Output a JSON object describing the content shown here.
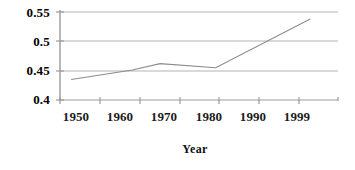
{
  "chart_data": {
    "type": "line",
    "title": "",
    "xlabel": "Year",
    "ylabel": "",
    "xlim": [
      1950,
      2000
    ],
    "ylim": [
      0.4,
      0.55
    ],
    "grid": true,
    "legend": "none",
    "x_tick_labels": [
      "1950",
      "1960",
      "1970",
      "1980",
      "1990",
      "1999"
    ],
    "x_tick_values": [
      1950,
      1960,
      1970,
      1980,
      1990,
      1999
    ],
    "y_tick_labels": [
      "0.4",
      "0.45",
      "0.5",
      "0.55"
    ],
    "y_tick_values": [
      0.4,
      0.45,
      0.5,
      0.55
    ],
    "series": [
      {
        "name": "",
        "x": [
          1952,
          1963,
          1968,
          1978,
          1995
        ],
        "values": [
          0.435,
          0.451,
          0.462,
          0.455,
          0.538
        ],
        "color": "#8c8c8c"
      }
    ]
  },
  "axes": {
    "axis_color": "#9a9a9a",
    "grid_color": "#b0b0b0",
    "tick_color": "#9a9a9a",
    "background": "#ffffff"
  }
}
